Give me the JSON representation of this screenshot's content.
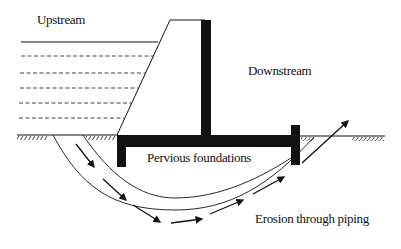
{
  "diagram": {
    "labels": {
      "upstream": "Upstream",
      "downstream": "Downstream",
      "foundations": "Pervious foundations",
      "erosion": "Erosion through piping"
    },
    "colors": {
      "ink": "#111111",
      "background": "#ffffff"
    }
  }
}
